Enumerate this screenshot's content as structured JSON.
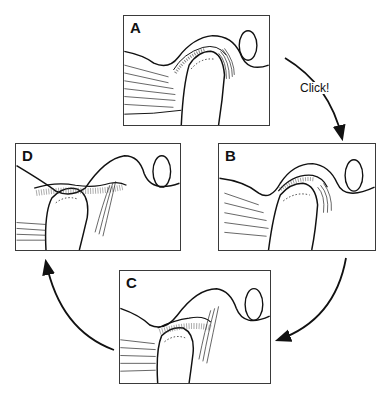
{
  "figure": {
    "type": "cyclic-sequence-diagram",
    "colors": {
      "line": "#111111",
      "frame": "#3a3a3a",
      "background": "#ffffff"
    },
    "panels": [
      {
        "id": "A",
        "label": "A",
        "position": "top"
      },
      {
        "id": "B",
        "label": "B",
        "position": "right"
      },
      {
        "id": "C",
        "label": "C",
        "position": "bottom"
      },
      {
        "id": "D",
        "label": "D",
        "position": "left"
      }
    ],
    "arrows": [
      {
        "from": "A",
        "to": "B",
        "direction": "clockwise",
        "label": "Click!"
      },
      {
        "from": "B",
        "to": "C",
        "direction": "clockwise",
        "label": ""
      },
      {
        "from": "C",
        "to": "D",
        "direction": "clockwise",
        "label": ""
      }
    ]
  }
}
